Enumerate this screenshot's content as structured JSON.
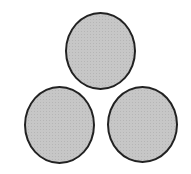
{
  "diagram": {
    "fill_color": "#c0c0c0",
    "stroke_color": "#222222",
    "circles": [
      {
        "id": "top",
        "left": 65,
        "top": 12,
        "width": 71,
        "height": 78
      },
      {
        "id": "bottom-left",
        "left": 24,
        "top": 86,
        "width": 71,
        "height": 78
      },
      {
        "id": "bottom-right",
        "left": 107,
        "top": 86,
        "width": 71,
        "height": 77
      }
    ]
  }
}
